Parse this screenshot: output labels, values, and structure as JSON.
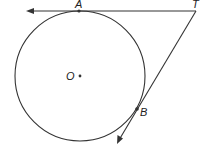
{
  "diagram": {
    "type": "circle-with-tangents",
    "colors": {
      "stroke": "#333333",
      "background": "#ffffff"
    },
    "circle": {
      "center_label": "O",
      "cx": 80,
      "cy": 76,
      "r": 65
    },
    "points": [
      {
        "label": "A",
        "x": 79,
        "y": 11
      },
      {
        "label": "T",
        "x": 196,
        "y": 11
      },
      {
        "label": "B",
        "x": 137,
        "y": 109
      },
      {
        "label": "O",
        "x": 80,
        "y": 76
      }
    ],
    "lines": [
      {
        "name": "tangent-TA",
        "from": "T",
        "to_arrow": [
          26,
          11
        ]
      },
      {
        "name": "tangent-TB",
        "from": "T",
        "to_arrow": [
          117,
          144
        ]
      }
    ]
  },
  "labels": {
    "A": "A",
    "T": "T",
    "B": "B",
    "O": "O"
  }
}
